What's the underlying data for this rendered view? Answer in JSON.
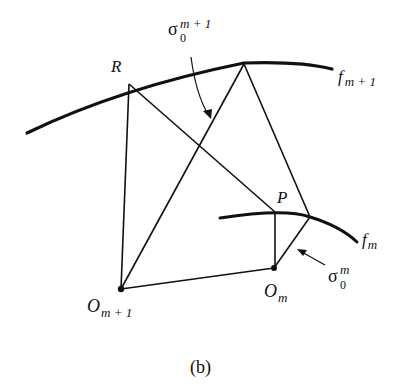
{
  "figure": {
    "caption": "(b)",
    "curves": {
      "outer": {
        "label_main": "f",
        "label_sub": "m + 1"
      },
      "inner": {
        "label_main": "f",
        "label_sub": "m"
      }
    },
    "points": {
      "R": "R",
      "P": "P",
      "O_m_plus_1": {
        "main": "O",
        "sub": "m + 1"
      },
      "O_m": {
        "main": "O",
        "sub": "m"
      }
    },
    "annotations": {
      "sigma_outer": {
        "main": "σ",
        "sub": "0",
        "sup": "m + 1"
      },
      "sigma_inner": {
        "main": "σ",
        "sub": "0",
        "sup": "m"
      }
    },
    "colors": {
      "ink": "#111111",
      "background": "#ffffff"
    }
  }
}
